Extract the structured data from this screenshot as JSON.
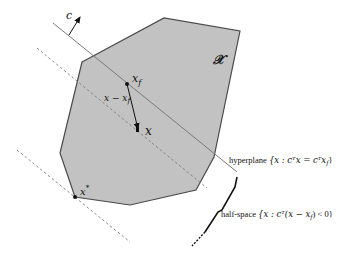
{
  "diagram": {
    "colors": {
      "feasible_fill": "#c2c2c2",
      "feasible_stroke": "#4a4a4a",
      "hyperplane": "#7a7a7a",
      "dashed": "#7a7a7a",
      "ink": "#111111",
      "background": "#ffffff"
    },
    "labels": {
      "cost_vector": "c",
      "set": "𝒳",
      "xf": "x",
      "xf_sub": "f",
      "diff": "x − x",
      "diff_sub": "f",
      "x": "x",
      "xstar": "x",
      "xstar_sup": "*",
      "hyperplane_prefix": "hyperplane",
      "hyperplane_expr": "{x : cᵀx = cᵀx",
      "hyperplane_sub": "f",
      "hyperplane_close": "}",
      "halfspace_prefix": "half-space",
      "halfspace_expr": "{x : cᵀ(x − x",
      "halfspace_sub": "f",
      "halfspace_close": ") < 0}"
    },
    "polygon": {
      "name": "feasible-set",
      "points": [
        [
          82,
          62
        ],
        [
          164,
          18
        ],
        [
          240,
          31
        ],
        [
          214,
          157
        ],
        [
          196,
          190
        ],
        [
          130,
          205
        ],
        [
          75,
          197
        ],
        [
          60,
          153
        ]
      ]
    },
    "points": {
      "xf": [
        127,
        84
      ],
      "x": [
        138,
        131
      ],
      "xstar": [
        75,
        197
      ]
    }
  }
}
